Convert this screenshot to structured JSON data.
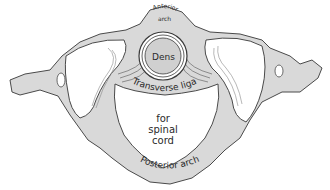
{
  "figure": {
    "colors": {
      "bone": "#d9d9d9",
      "bone_dark": "#bdbdbd",
      "facet": "#ffffff",
      "outline": "#4a4a4a",
      "background": "#ffffff"
    },
    "labels": {
      "anterior_arch_line1": "Anterior",
      "anterior_arch_line2": "arch",
      "dens": "Dens",
      "transverse_ligament": "Transverse ligament",
      "spinal_cord_line1": "for",
      "spinal_cord_line2": "spinal",
      "spinal_cord_line3": "cord",
      "posterior_arch": "Posterior arch"
    }
  }
}
